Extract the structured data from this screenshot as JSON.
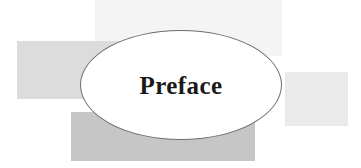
{
  "page": {
    "kind": "book-chapter-opener",
    "width": 361,
    "height": 168,
    "background_color": "#ffffff"
  },
  "heading": {
    "text": "Preface",
    "color": "#1a1a1a",
    "style": "serif-bold"
  },
  "ellipse": {
    "name": "title-ellipse",
    "fill_color": "#ffffff",
    "outline_color": "#6e6e6e"
  },
  "decoration": {
    "rectangles": [
      {
        "name": "top-band",
        "color": "#f4f4f4"
      },
      {
        "name": "left-band",
        "color": "#dcdcdc"
      },
      {
        "name": "right-band",
        "color": "#eaeaea"
      },
      {
        "name": "bottom-band",
        "color": "#c6c6c6"
      }
    ]
  }
}
